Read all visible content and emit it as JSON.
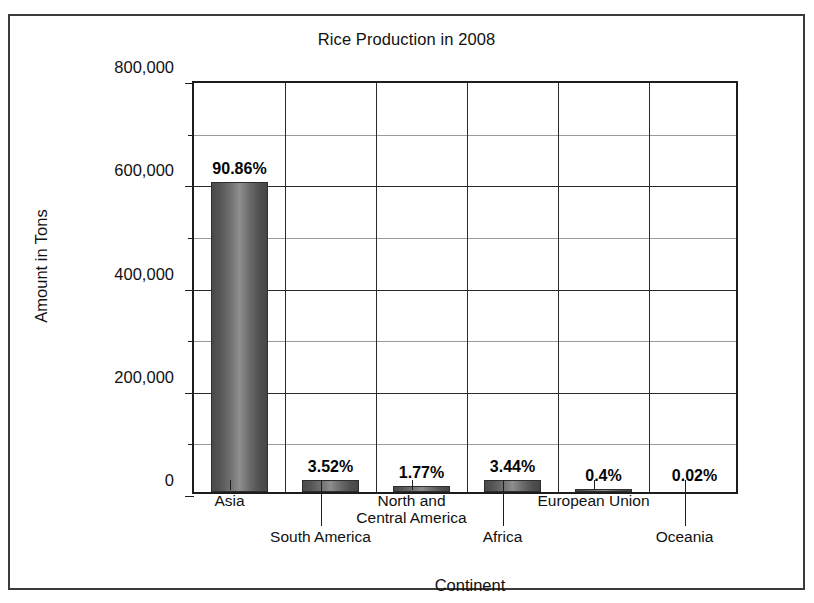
{
  "chart_data": {
    "type": "bar",
    "title": "Rice Production in 2008",
    "xlabel": "Continent",
    "ylabel": "Amount in Tons",
    "categories": [
      "Asia",
      "South America",
      "North and\nCentral America",
      "Africa",
      "European Union",
      "Oceania"
    ],
    "values": [
      600000,
      23000,
      12000,
      22500,
      2600,
      130
    ],
    "data_labels": [
      "90.86%",
      "3.52%",
      "1.77%",
      "3.44%",
      "0.4%",
      "0.02%"
    ],
    "percentages": [
      90.86,
      3.52,
      1.77,
      3.44,
      0.4,
      0.02
    ],
    "ylim": [
      0,
      800000
    ],
    "ytick_labels": [
      "800,000",
      "600,000",
      "400,000",
      "200,000",
      "0"
    ],
    "ytick_values": [
      800000,
      600000,
      400000,
      200000,
      0
    ],
    "yminor_values": [
      700000,
      500000,
      300000,
      100000
    ],
    "grid": "major horizontal and vertical gridlines with minor horizontal gridlines",
    "legend": "none",
    "bar_color": "#6b6b6b",
    "axis_color": "#1d1d1d",
    "grid_color": "#2a2a2a",
    "minor_grid_color": "#9a9a9a",
    "label_rows": [
      0,
      1,
      0,
      1,
      0,
      1
    ]
  }
}
